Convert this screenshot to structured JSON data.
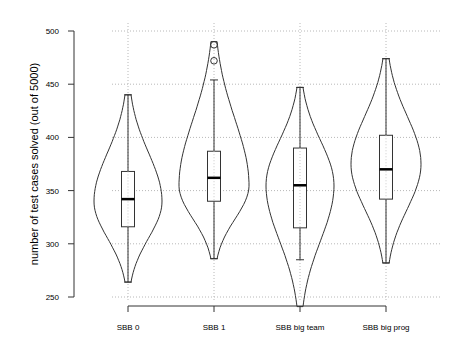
{
  "chart_data": {
    "type": "violin",
    "title": "",
    "xlabel": "",
    "ylabel": "number of test cases solved (out of 5000)",
    "ylim": [
      250,
      500
    ],
    "yticks": [
      250,
      300,
      350,
      400,
      450,
      500
    ],
    "grid": true,
    "categories": [
      "SBB 0",
      "SBB 1",
      "SBB big team",
      "SBB big prog"
    ],
    "series": [
      {
        "name": "SBB 0",
        "min": 264,
        "q1": 316,
        "median": 342,
        "q3": 368,
        "max": 440,
        "outliers": [],
        "violin_range": [
          264,
          440
        ],
        "violin_peak": 340,
        "violin_halfwidth": 34
      },
      {
        "name": "SBB 1",
        "min": 286,
        "q1": 340,
        "median": 362,
        "q3": 387,
        "max": 454,
        "outliers": [
          472,
          487
        ],
        "violin_range": [
          286,
          490
        ],
        "violin_peak": 355,
        "violin_halfwidth": 35
      },
      {
        "name": "SBB big team",
        "min": 285,
        "q1": 315,
        "median": 355,
        "q3": 390,
        "max": 447,
        "outliers": [],
        "violin_range": [
          241,
          447
        ],
        "violin_peak": 355,
        "violin_halfwidth": 34
      },
      {
        "name": "SBB big prog",
        "min": 282,
        "q1": 342,
        "median": 370,
        "q3": 402,
        "max": 474,
        "outliers": [],
        "violin_range": [
          282,
          474
        ],
        "violin_peak": 375,
        "violin_halfwidth": 35
      }
    ]
  }
}
